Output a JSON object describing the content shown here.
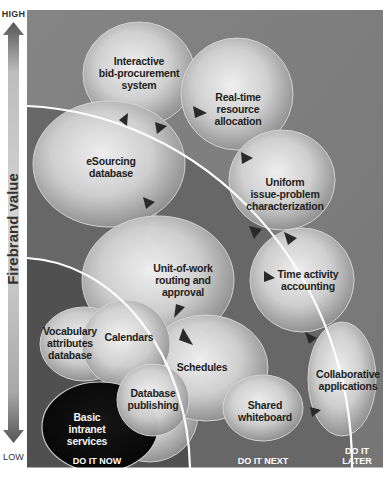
{
  "axis": {
    "high_label": "HIGH",
    "low_label": "LOW",
    "title": "Firebrand value"
  },
  "zones": [
    {
      "label": "DO IT NOW",
      "color": "#4f4f4f"
    },
    {
      "label": "DO IT NEXT",
      "color": "#666666"
    },
    {
      "label_line1": "DO IT",
      "label_line2": "LATER",
      "color": "#7b7b7b"
    }
  ],
  "bubbles": [
    {
      "id": "interactive-bid-procurement-system",
      "lines": [
        "Interactive",
        "bid-procurement",
        "system"
      ]
    },
    {
      "id": "real-time-resource-allocation",
      "lines": [
        "Real-time",
        "resource",
        "allocation"
      ]
    },
    {
      "id": "esourcing-database",
      "lines": [
        "eSourcing",
        "database"
      ]
    },
    {
      "id": "uniform-issue-problem-characterization",
      "lines": [
        "Uniform",
        "issue-problem",
        "characterization"
      ]
    },
    {
      "id": "unit-of-work-routing-and-approval",
      "lines": [
        "Unit-of-work",
        "routing and",
        "approval"
      ]
    },
    {
      "id": "time-activity-accounting",
      "lines": [
        "Time activity",
        "accounting"
      ]
    },
    {
      "id": "vocabulary-attributes-database",
      "lines": [
        "Vocabulary",
        "attributes",
        "database"
      ]
    },
    {
      "id": "calendars",
      "lines": [
        "Calendars"
      ]
    },
    {
      "id": "schedules",
      "lines": [
        "Schedules"
      ]
    },
    {
      "id": "collaborative-applications",
      "lines": [
        "Collaborative",
        "applications"
      ]
    },
    {
      "id": "basic-intranet-services",
      "lines": [
        "Basic",
        "intranet",
        "services"
      ]
    },
    {
      "id": "database-publishing",
      "lines": [
        "Database",
        "publishing"
      ]
    },
    {
      "id": "shared-whiteboard",
      "lines": [
        "Shared",
        "whiteboard"
      ]
    }
  ],
  "colors": {
    "background_later": "#7b7b7b",
    "background_next": "#666666",
    "background_now": "#4f4f4f",
    "arc_line": "#ffffff",
    "bubble_highlight": "#f2f2f2",
    "bubble_shadow": "#9a9a9a",
    "basic_bubble": "#0e0e0e",
    "arrow": "#2a2a2a"
  }
}
